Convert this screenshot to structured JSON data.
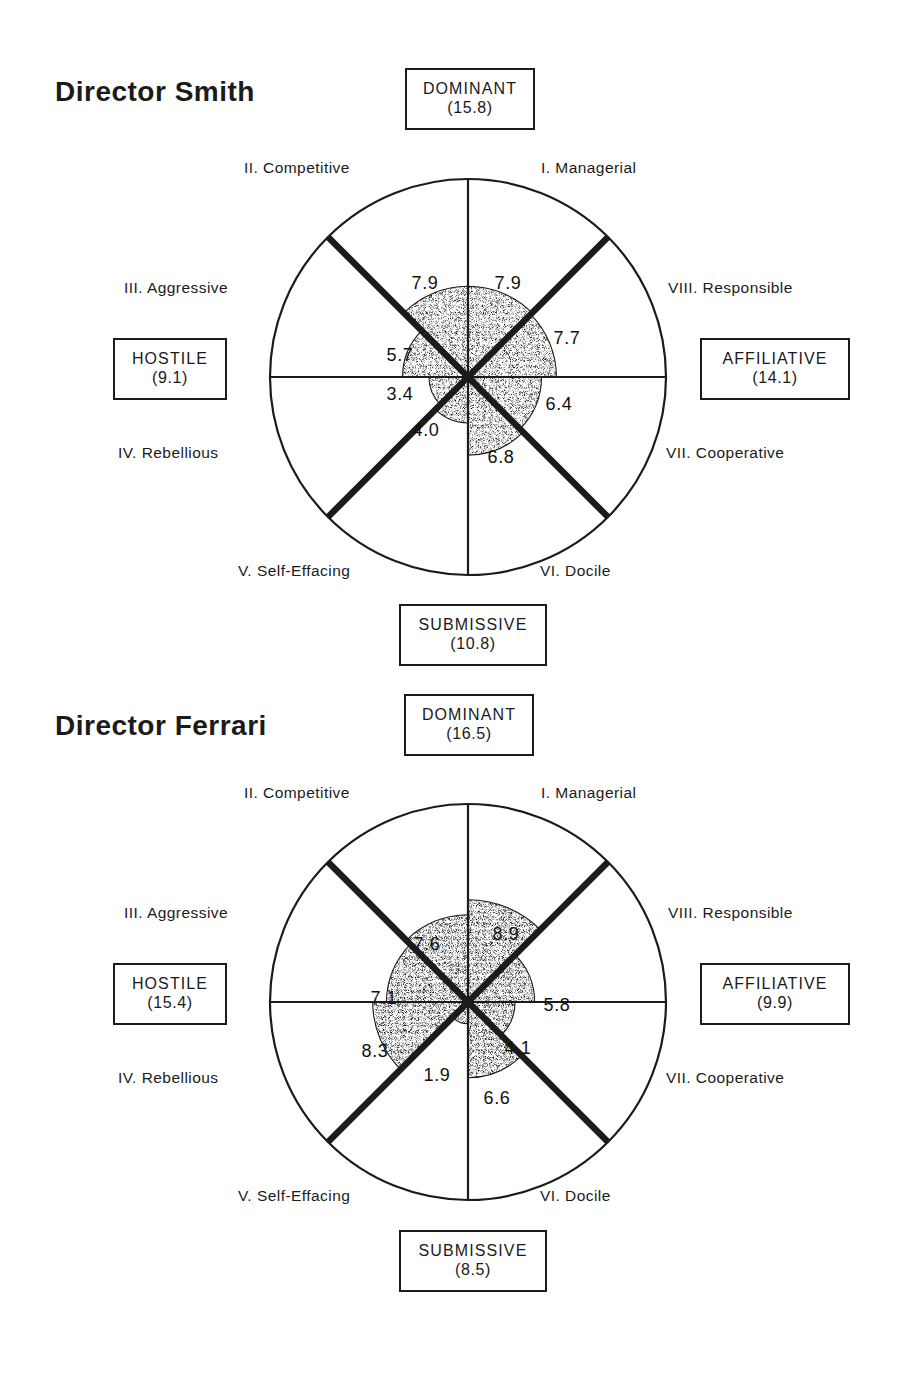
{
  "chart_data": [
    {
      "type": "pie",
      "title": "Director  Smith",
      "subtype": "interpersonal-circumplex-octant-wheel",
      "scale_max": 10,
      "categories": [
        "I. Managerial",
        "VIII. Responsible",
        "VII. Cooperative",
        "VI. Docile",
        "V. Self-Effacing",
        "IV. Rebellious",
        "III. Aggressive",
        "II. Competitive"
      ],
      "values": [
        7.9,
        7.7,
        6.4,
        6.8,
        4.0,
        3.4,
        5.7,
        7.9
      ],
      "poles": [
        {
          "name": "DOMINANT",
          "value": "(15.8)",
          "position": "top"
        },
        {
          "name": "AFFILIATIVE",
          "value": "(14.1)",
          "position": "right"
        },
        {
          "name": "SUBMISSIVE",
          "value": "(10.8)",
          "position": "bottom"
        },
        {
          "name": "HOSTILE",
          "value": "(9.1)",
          "position": "left"
        }
      ],
      "legend": "",
      "grid": false
    },
    {
      "type": "pie",
      "title": "Director  Ferrari",
      "subtype": "interpersonal-circumplex-octant-wheel",
      "scale_max": 10,
      "categories": [
        "I. Managerial",
        "VIII. Responsible",
        "VII. Cooperative",
        "VI. Docile",
        "V. Self-Effacing",
        "IV. Rebellious",
        "III. Aggressive",
        "II. Competitive"
      ],
      "values": [
        8.9,
        5.8,
        4.1,
        6.6,
        1.9,
        8.3,
        7.1,
        7.6
      ],
      "poles": [
        {
          "name": "DOMINANT",
          "value": "(16.5)",
          "position": "top"
        },
        {
          "name": "AFFILIATIVE",
          "value": "(9.9)",
          "position": "right"
        },
        {
          "name": "SUBMISSIVE",
          "value": "(8.5)",
          "position": "bottom"
        },
        {
          "name": "HOSTILE",
          "value": "(15.4)",
          "position": "left"
        }
      ],
      "legend": "",
      "grid": false
    }
  ],
  "charts": [
    {
      "title": "Director  Smith",
      "octants": [
        {
          "id": "I",
          "label": "I. Managerial",
          "value": "7.9"
        },
        {
          "id": "VIII",
          "label": "VIII. Responsible",
          "value": "7.7"
        },
        {
          "id": "VII",
          "label": "VII. Cooperative",
          "value": "6.4"
        },
        {
          "id": "VI",
          "label": "VI. Docile",
          "value": "6.8"
        },
        {
          "id": "V",
          "label": "V. Self-Effacing",
          "value": "4.0"
        },
        {
          "id": "IV",
          "label": "IV. Rebellious",
          "value": "3.4"
        },
        {
          "id": "III",
          "label": "III. Aggressive",
          "value": "5.7"
        },
        {
          "id": "II",
          "label": "II. Competitive",
          "value": "7.9"
        }
      ],
      "poles": {
        "top": {
          "name": "DOMINANT",
          "value": "(15.8)"
        },
        "right": {
          "name": "AFFILIATIVE",
          "value": "(14.1)"
        },
        "bottom": {
          "name": "SUBMISSIVE",
          "value": "(10.8)"
        },
        "left": {
          "name": "HOSTILE",
          "value": "(9.1)"
        }
      }
    },
    {
      "title": "Director  Ferrari",
      "octants": [
        {
          "id": "I",
          "label": "I. Managerial",
          "value": "8.9"
        },
        {
          "id": "VIII",
          "label": "VIII. Responsible",
          "value": "5.8"
        },
        {
          "id": "VII",
          "label": "VII. Cooperative",
          "value": "4.1"
        },
        {
          "id": "VI",
          "label": "VI. Docile",
          "value": "6.6"
        },
        {
          "id": "V",
          "label": "V. Self-Effacing",
          "value": "1.9"
        },
        {
          "id": "IV",
          "label": "IV. Rebellious",
          "value": "8.3"
        },
        {
          "id": "III",
          "label": "III. Aggressive",
          "value": "7.1"
        },
        {
          "id": "II",
          "label": "II. Competitive",
          "value": "7.6"
        }
      ],
      "poles": {
        "top": {
          "name": "DOMINANT",
          "value": "(16.5)"
        },
        "right": {
          "name": "AFFILIATIVE",
          "value": "(9.9)"
        },
        "bottom": {
          "name": "SUBMISSIVE",
          "value": "(8.5)"
        },
        "left": {
          "name": "HOSTILE",
          "value": "(15.4)"
        }
      }
    }
  ],
  "colors": {
    "ink": "#1b1b1b",
    "background": "#ffffff",
    "stipple": "#3a3a3a"
  }
}
